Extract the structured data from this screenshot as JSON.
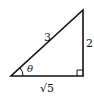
{
  "diagram": {
    "type": "right-triangle",
    "vertices": {
      "left": [
        11,
        76
      ],
      "right_angle": [
        83,
        76
      ],
      "top": [
        83,
        10
      ]
    },
    "labels": {
      "hypotenuse": "3",
      "opposite": "2",
      "adjacent": "√5",
      "angle": "θ"
    },
    "colors": {
      "stroke": "#111111",
      "background": "#ffffff"
    }
  }
}
